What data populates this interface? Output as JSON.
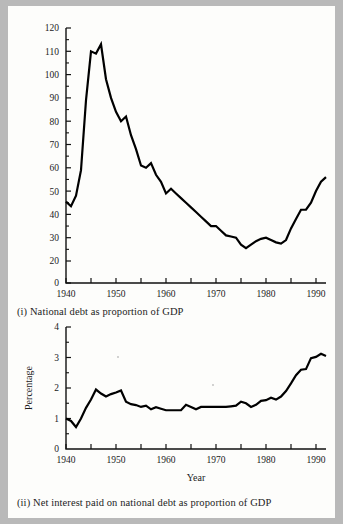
{
  "page": {
    "background_color": "#fdfdfb",
    "border_color": "#b9b9b9",
    "ink_color": "#000000"
  },
  "figures": [
    {
      "id": "figure-i",
      "caption": "(i) National debt as proportion of GDP",
      "xlabel": "Year",
      "ylabel": ""
    },
    {
      "id": "figure-ii",
      "caption": "(ii) Net interest paid on national debt as proportion of GDP",
      "xlabel": "Year",
      "ylabel": "Percentage"
    }
  ],
  "chart_data": [
    {
      "type": "line",
      "title": "",
      "caption": "(i) National debt as proportion of GDP",
      "xlabel": "Year",
      "ylabel": "",
      "xlim": [
        1940,
        1992
      ],
      "ylim": [
        0,
        120
      ],
      "xticks": [
        1940,
        1945,
        1950,
        1955,
        1960,
        1965,
        1970,
        1975,
        1980,
        1985,
        1990
      ],
      "xtick_labels": [
        "1940",
        "",
        "1950",
        "",
        "1960",
        "",
        "1970",
        "",
        "1980",
        "",
        "1990"
      ],
      "yticks": [
        0,
        20,
        30,
        40,
        50,
        60,
        70,
        80,
        90,
        100,
        110,
        120
      ],
      "ytick_labels": [
        "0",
        "20",
        "30",
        "40",
        "50",
        "60",
        "70",
        "80",
        "90",
        "100",
        "110",
        "120"
      ],
      "grid": false,
      "legend": null,
      "series": [
        {
          "name": "National debt as proportion of GDP",
          "x": [
            1940,
            1941,
            1942,
            1943,
            1944,
            1945,
            1946,
            1947,
            1948,
            1949,
            1950,
            1951,
            1952,
            1953,
            1954,
            1955,
            1956,
            1957,
            1958,
            1959,
            1960,
            1961,
            1962,
            1963,
            1964,
            1965,
            1966,
            1967,
            1968,
            1969,
            1970,
            1971,
            1972,
            1973,
            1974,
            1975,
            1976,
            1977,
            1978,
            1979,
            1980,
            1981,
            1982,
            1983,
            1984,
            1985,
            1986,
            1987,
            1988,
            1989,
            1990,
            1991,
            1992
          ],
          "values": [
            45.5,
            43.5,
            48,
            59,
            89,
            110,
            109,
            113,
            98,
            90,
            84,
            80,
            82,
            74,
            68,
            61,
            60,
            62,
            57,
            54,
            49,
            51,
            49,
            47,
            45,
            43,
            41,
            39,
            37,
            35,
            35,
            33,
            31,
            30.5,
            30,
            27,
            25.5,
            27,
            28.5,
            29.5,
            30,
            29,
            28,
            27.5,
            29,
            34,
            38,
            42,
            42,
            45,
            50,
            54,
            56,
            57,
            59,
            62,
            64
          ]
        }
      ]
    },
    {
      "type": "line",
      "title": "",
      "caption": "(ii) Net interest paid on national debt as proportion of GDP",
      "xlabel": "Year",
      "ylabel": "Percentage",
      "xlim": [
        1940,
        1992
      ],
      "ylim": [
        0,
        4
      ],
      "xticks": [
        1940,
        1945,
        1950,
        1955,
        1960,
        1965,
        1970,
        1975,
        1980,
        1985,
        1990
      ],
      "xtick_labels": [
        "1940",
        "",
        "1950",
        "",
        "1960",
        "",
        "1970",
        "",
        "1980",
        "",
        "1990"
      ],
      "yticks": [
        0,
        1,
        2,
        3,
        4
      ],
      "ytick_labels": [
        "0",
        "1",
        "2",
        "3",
        "4"
      ],
      "grid": false,
      "legend": null,
      "series": [
        {
          "name": "Net interest paid on national debt as proportion of GDP",
          "x": [
            1940,
            1941,
            1942,
            1943,
            1944,
            1945,
            1946,
            1947,
            1948,
            1949,
            1950,
            1951,
            1952,
            1953,
            1954,
            1955,
            1956,
            1957,
            1958,
            1959,
            1960,
            1961,
            1962,
            1963,
            1964,
            1965,
            1966,
            1967,
            1968,
            1969,
            1970,
            1971,
            1972,
            1973,
            1974,
            1975,
            1976,
            1977,
            1978,
            1979,
            1980,
            1981,
            1982,
            1983,
            1984,
            1985,
            1986,
            1987,
            1988,
            1989,
            1990,
            1991,
            1992
          ],
          "values": [
            1.0,
            0.92,
            0.72,
            1.0,
            1.35,
            1.62,
            1.95,
            1.82,
            1.72,
            1.8,
            1.85,
            1.92,
            1.55,
            1.47,
            1.44,
            1.38,
            1.42,
            1.3,
            1.37,
            1.32,
            1.27,
            1.27,
            1.27,
            1.27,
            1.45,
            1.38,
            1.3,
            1.38,
            1.38,
            1.38,
            1.38,
            1.38,
            1.38,
            1.4,
            1.42,
            1.55,
            1.5,
            1.38,
            1.45,
            1.58,
            1.6,
            1.68,
            1.62,
            1.72,
            1.9,
            2.15,
            2.42,
            2.6,
            2.62,
            2.98,
            3.02,
            3.12,
            3.05,
            3.05,
            3.18,
            3.3,
            3.35
          ]
        }
      ]
    }
  ]
}
